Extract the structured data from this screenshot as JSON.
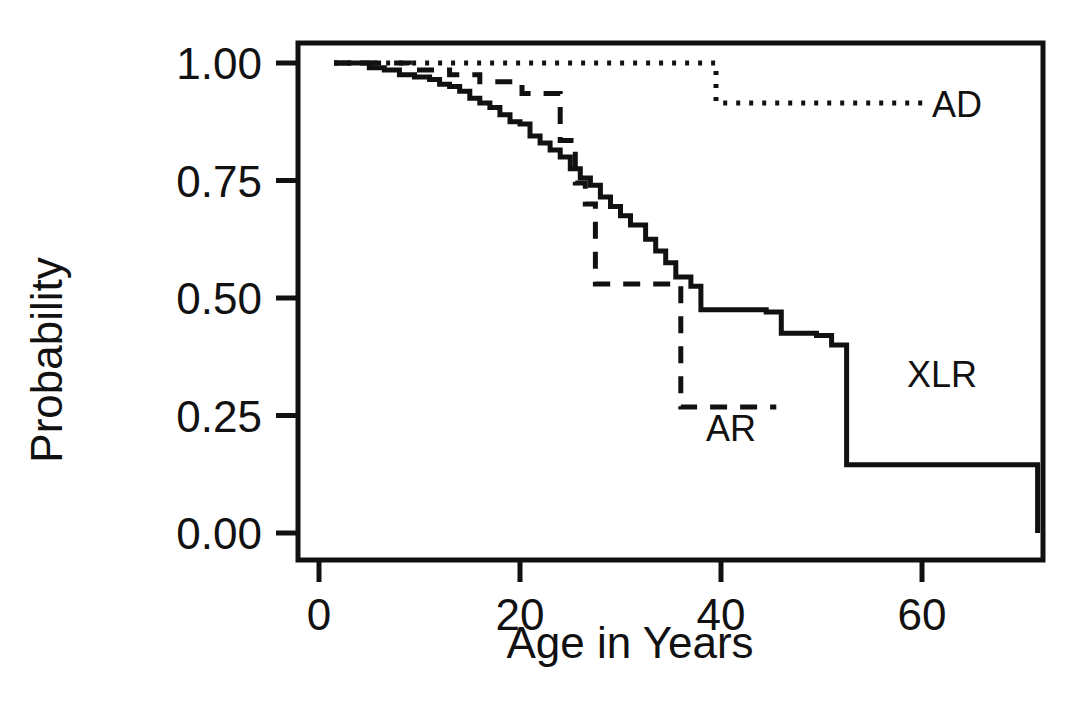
{
  "figure": {
    "background_color": "#ffffff",
    "ink_color": "#111111"
  },
  "chart_data": {
    "type": "line",
    "title": "",
    "subtitle": "",
    "xlabel": "Age in Years",
    "ylabel": "Probability",
    "xlim": [
      0,
      72
    ],
    "ylim": [
      0.0,
      1.0
    ],
    "grid": false,
    "legend_position": "inline-annotations",
    "xticks": [
      0,
      20,
      40,
      60
    ],
    "xticklabels": [
      "0",
      "20",
      "40",
      "60"
    ],
    "yticks": [
      0.0,
      0.25,
      0.5,
      0.75,
      1.0
    ],
    "yticklabels": [
      "0.00",
      "0.25",
      "0.50",
      "0.75",
      "1.00"
    ],
    "annotations": [
      {
        "text": "AD",
        "x": 61.0,
        "y": 0.885
      },
      {
        "text": "AR",
        "x": 38.5,
        "y": 0.195
      },
      {
        "text": "XLR",
        "x": 58.5,
        "y": 0.31
      }
    ],
    "series": [
      {
        "name": "AD",
        "label": "AD",
        "style": "dotted",
        "step": "post",
        "x": [
          1.5,
          3.0,
          5.0,
          8.0,
          12.0,
          18.0,
          25.0,
          30.0,
          35.0,
          39.5,
          39.5,
          45.0,
          52.0,
          58.0,
          60.5
        ],
        "y": [
          1.0,
          1.0,
          1.0,
          1.0,
          1.0,
          1.0,
          1.0,
          1.0,
          1.0,
          1.0,
          0.915,
          0.915,
          0.915,
          0.915,
          0.915
        ]
      },
      {
        "name": "AR",
        "label": "AR",
        "style": "dashed",
        "step": "post",
        "x": [
          1.5,
          5.5,
          9.0,
          13.0,
          16.0,
          19.0,
          20.2,
          22.5,
          24.0,
          25.5,
          26.5,
          27.5,
          30.5,
          33.0,
          34.5,
          36.0,
          40.0,
          45.5
        ],
        "y": [
          1.0,
          1.0,
          0.985,
          0.975,
          0.96,
          0.96,
          0.935,
          0.935,
          0.835,
          0.745,
          0.7,
          0.53,
          0.53,
          0.53,
          0.53,
          0.268,
          0.268,
          0.268
        ]
      },
      {
        "name": "XLR",
        "label": "XLR",
        "style": "solid",
        "step": "post",
        "x": [
          1.5,
          3.5,
          5.0,
          6.5,
          8.0,
          9.5,
          11.0,
          12.0,
          13.0,
          14.0,
          15.0,
          16.0,
          17.0,
          18.0,
          19.0,
          20.0,
          21.0,
          22.0,
          23.0,
          24.0,
          25.0,
          26.0,
          27.0,
          28.0,
          29.0,
          30.0,
          31.0,
          32.5,
          33.5,
          34.5,
          35.5,
          37.0,
          38.0,
          41.0,
          44.5,
          46.0,
          49.5,
          51.0,
          52.5,
          70.0,
          71.5
        ],
        "y": [
          1.0,
          1.0,
          0.99,
          0.985,
          0.975,
          0.97,
          0.965,
          0.955,
          0.95,
          0.94,
          0.925,
          0.915,
          0.905,
          0.89,
          0.875,
          0.87,
          0.845,
          0.83,
          0.815,
          0.8,
          0.775,
          0.755,
          0.74,
          0.715,
          0.695,
          0.675,
          0.655,
          0.625,
          0.6,
          0.575,
          0.545,
          0.525,
          0.475,
          0.475,
          0.47,
          0.425,
          0.42,
          0.4,
          0.145,
          0.145,
          0.0
        ]
      }
    ]
  }
}
